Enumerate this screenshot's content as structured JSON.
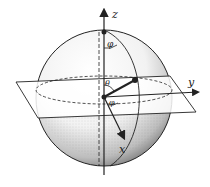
{
  "diagram": {
    "axes": {
      "x": "x",
      "y": "y",
      "z": "z"
    },
    "angles": {
      "polar": "θ",
      "azimuth": "φ"
    },
    "colors": {
      "ink": "#222222",
      "background": "#ffffff",
      "stipple": "#555555"
    }
  }
}
